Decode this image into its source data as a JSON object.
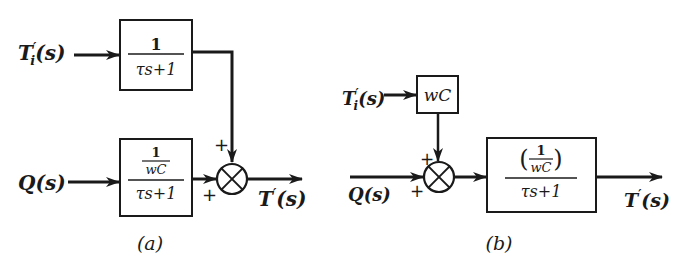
{
  "diagram_a": {
    "caption": "(a)",
    "input_top": {
      "base": "T",
      "prime": "′",
      "sub": "i",
      "arg": "(s)"
    },
    "input_bottom": {
      "text": "Q(s)"
    },
    "block_top": {
      "numerator": "1",
      "denominator": "τs+1"
    },
    "block_bottom": {
      "numerator_top": "1",
      "numerator_bottom": "wC",
      "denominator": "τs+1"
    },
    "summing_junction": {
      "sign_top": "+",
      "sign_left": "+"
    },
    "output": {
      "base": "T",
      "prime": "′",
      "arg": "(s)"
    }
  },
  "diagram_b": {
    "caption": "(b)",
    "input_top": {
      "base": "T",
      "prime": "′",
      "sub": "i",
      "arg": "(s)"
    },
    "input_left": {
      "text": "Q(s)"
    },
    "block_gain": {
      "text": "wC"
    },
    "block_main": {
      "numerator_top": "1",
      "numerator_bottom": "wC",
      "paren_open": "(",
      "paren_close": ")",
      "denominator": "τs+1"
    },
    "summing_junction": {
      "sign_top": "+",
      "sign_left": "+"
    },
    "output": {
      "base": "T",
      "prime": "′",
      "arg": "(s)"
    }
  },
  "colors": {
    "ink": "#1a1a1a",
    "background": "#ffffff"
  }
}
